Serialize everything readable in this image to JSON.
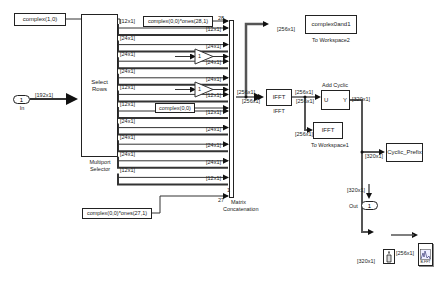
{
  "diagram": {
    "type": "simulink-model",
    "blocks": {
      "complex10": "complex(1,0)",
      "inport": {
        "number": "1",
        "name": "In"
      },
      "selector": {
        "text_line1": "Select",
        "text_line2": "Rows",
        "name_line1": "Multiport",
        "name_line2": "Selector"
      },
      "const28": "complex(0,0)*ones(28,1)",
      "const27": "complex(0,0)*ones(27,1)",
      "complex00": "complex(0,0)",
      "gain1": "1",
      "gain2": "1",
      "concat": {
        "name_line1": "Matrix",
        "name_line2": "Concatenation",
        "port_top": "28",
        "port_bottom": "27",
        "port_one": "1"
      },
      "ifft": {
        "text": "IFFT",
        "name": "IFFT"
      },
      "toworkspace2": {
        "text": "complex0and1",
        "name": "To Workspace2"
      },
      "addcp": {
        "name_line1": "Add Cyclic",
        "name_line2": "Prefix",
        "in_port": "U",
        "out_port": "Y"
      },
      "toworkspace1": {
        "text": "IFFT",
        "name": "To Workspace1"
      },
      "cyclic_prefix": {
        "text": "Cyclic_Prefix"
      },
      "outport": {
        "number": "1",
        "name": "Out"
      },
      "bfft": {
        "text": "B-FFT"
      }
    },
    "signal_labels": {
      "in": "[192x1]",
      "sel_outputs": [
        "[12x1]",
        "[24x1]",
        "[24x1]",
        "[24x1]",
        "[12x1]",
        "[12x1]",
        "[24x1]",
        "[24x1]",
        "[24x1]",
        "[12x1]"
      ],
      "concat_inputs": [
        "[12x1]",
        "[24x1]",
        "[24x1]",
        "[24x1]",
        "[12x1]",
        "[12x1]",
        "[24x1]",
        "[24x1]",
        "[24x1]",
        "[12x1]"
      ],
      "concat_out": "[256x1]",
      "concat_out2": "[256x1]",
      "to_ws2": "[256x1]",
      "ifft_out": "[256x1]",
      "ifft_out2": "[256x1]",
      "to_ws1": "[256x1]",
      "cp_out": "[320x1]",
      "cp_to_scope": "[320x1]",
      "to_out": "[320x1]",
      "to_buffer": "[320x1]",
      "buffer_out": "[256x1]"
    }
  }
}
